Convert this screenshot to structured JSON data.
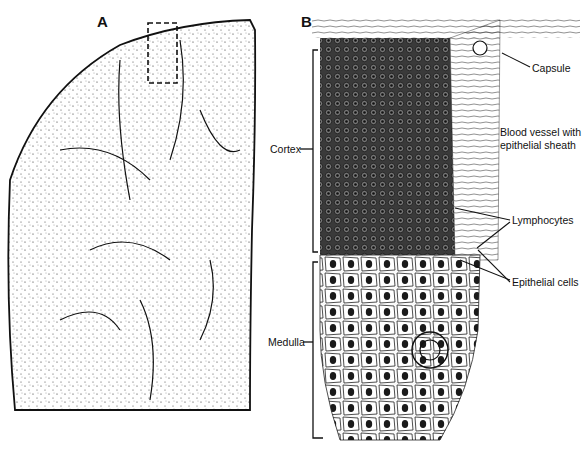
{
  "figure": {
    "panel_a": {
      "letter": "A",
      "description": "Low-magnification thymus lobe section with dashed box marking enlarged region"
    },
    "panel_b": {
      "letter": "B",
      "labels": {
        "capsule": "Capsule",
        "blood_vessel_line1": "Blood vessel with",
        "blood_vessel_line2": "epithelial sheath",
        "lymphocytes": "Lymphocytes",
        "epithelial_cells": "Epithelial cells",
        "cortex": "Cortex",
        "medulla": "Medulla"
      }
    }
  },
  "colors": {
    "ink": "#111111",
    "background": "#ffffff",
    "tissue_dark": "#2a2a2a",
    "tissue_light": "#f2f2f2"
  }
}
